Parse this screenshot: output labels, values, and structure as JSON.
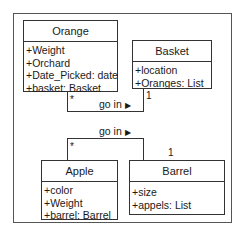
{
  "diagram": {
    "type": "uml-class-diagram",
    "classes": [
      {
        "name": "Orange",
        "attributes": [
          "+Weight",
          "+Orchard",
          "+Date_Picked: date",
          "+basket: Basket"
        ]
      },
      {
        "name": "Basket",
        "attributes": [
          "+location",
          "+Oranges: List"
        ]
      },
      {
        "name": "Apple",
        "attributes": [
          "+color",
          "+Weight",
          "+barrel: Barrel"
        ]
      },
      {
        "name": "Barrel",
        "attributes": [
          "+size",
          "+appels: List"
        ]
      }
    ],
    "associations": [
      {
        "from": "Orange",
        "to": "Basket",
        "label": "go in",
        "arrow": "▶",
        "from_mult": "*",
        "to_mult": "1"
      },
      {
        "from": "Apple",
        "to": "Barrel",
        "label": "go in",
        "arrow": "▶",
        "from_mult": "*",
        "to_mult": "1"
      }
    ]
  }
}
